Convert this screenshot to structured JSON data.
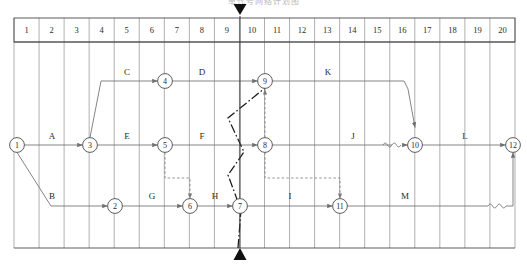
{
  "caption": "单代号网络计划图",
  "colors": {
    "line": "#6f6f6f",
    "grid": "#8e8e8e",
    "border": "#4a4a4a",
    "text": "#2b2b2b",
    "critical": "#1a1a1a",
    "dashed": "#7a7a7a"
  },
  "timescale": {
    "label": "time-scale-header",
    "ticks": [
      "1",
      "2",
      "3",
      "4",
      "5",
      "6",
      "7",
      "8",
      "9",
      "10",
      "11",
      "12",
      "13",
      "14",
      "15",
      "16",
      "17",
      "18",
      "19",
      "20"
    ],
    "x0": 14,
    "x1": 515,
    "col_w": 25.05,
    "top": 18,
    "header_h": 24,
    "grid_bottom": 248
  },
  "marker": {
    "name": "current-time-marker",
    "x": 240,
    "tick": 9,
    "top_triangle": true,
    "bottom_triangle": true
  },
  "rows": {
    "top": 81,
    "middle": 145,
    "bottom": 206
  },
  "nodes": [
    {
      "id": "1",
      "x": 17,
      "y": 145
    },
    {
      "id": "2",
      "x": 115,
      "y": 206
    },
    {
      "id": "3",
      "x": 90,
      "y": 145
    },
    {
      "id": "4",
      "x": 165,
      "y": 81
    },
    {
      "id": "5",
      "x": 165,
      "y": 145
    },
    {
      "id": "6",
      "x": 190,
      "y": 206
    },
    {
      "id": "7",
      "x": 240,
      "y": 206
    },
    {
      "id": "8",
      "x": 265,
      "y": 145
    },
    {
      "id": "9",
      "x": 265,
      "y": 81
    },
    {
      "id": "10",
      "x": 415,
      "y": 145
    },
    {
      "id": "11",
      "x": 340,
      "y": 206
    },
    {
      "id": "12",
      "x": 513,
      "y": 145
    }
  ],
  "activities": [
    {
      "label": "A",
      "x": 52,
      "y": 139,
      "from": "1",
      "to": "3"
    },
    {
      "label": "B",
      "x": 52,
      "y": 199,
      "from": "1",
      "to": "2"
    },
    {
      "label": "C",
      "x": 127,
      "y": 75,
      "from": "3",
      "to": "4"
    },
    {
      "label": "D",
      "x": 202,
      "y": 75,
      "from": "4",
      "to": "9"
    },
    {
      "label": "E",
      "x": 127,
      "y": 139,
      "from": "3",
      "to": "5"
    },
    {
      "label": "F",
      "x": 202,
      "y": 139,
      "from": "5",
      "to": "8"
    },
    {
      "label": "G",
      "x": 152,
      "y": 199,
      "from": "2",
      "to": "6"
    },
    {
      "label": "H",
      "x": 215,
      "y": 199,
      "from": "6",
      "to": "7"
    },
    {
      "label": "I",
      "x": 290,
      "y": 199,
      "from": "7",
      "to": "11"
    },
    {
      "label": "J",
      "x": 353,
      "y": 139,
      "from": "8",
      "to": "10"
    },
    {
      "label": "K",
      "x": 328,
      "y": 75,
      "from": "9",
      "to": "10"
    },
    {
      "label": "L",
      "x": 465,
      "y": 139,
      "from": "10",
      "to": "12"
    },
    {
      "label": "M",
      "x": 405,
      "y": 199,
      "from": "11",
      "to": "12"
    }
  ],
  "dummy_links": [
    {
      "name": "dummy-5-to-6",
      "from": "5",
      "to": "6"
    },
    {
      "name": "dummy-8-to-9",
      "from": "8",
      "to": "9"
    },
    {
      "name": "dummy-8-to-11",
      "from": "8",
      "to": "11"
    }
  ],
  "float_marks": [
    {
      "name": "float-wave-before-10",
      "x": 392,
      "y": 145
    },
    {
      "name": "float-wave-before-12",
      "x": 497,
      "y": 206
    }
  ],
  "critical_path": {
    "name": "critical-path-chain",
    "style": "dash-dot",
    "points": "238,248 241,210 228,175 244,152 228,118 265,88"
  }
}
